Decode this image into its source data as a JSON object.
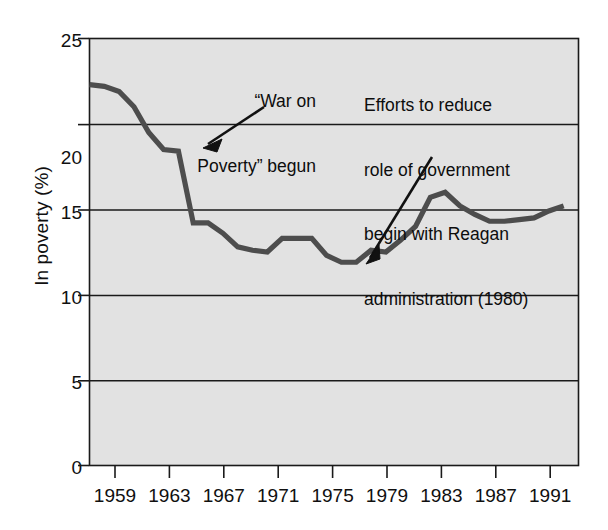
{
  "chart_data": {
    "type": "line",
    "title": "",
    "subtitle": "",
    "xlabel": "",
    "ylabel": "In poverty (%)",
    "xlim": [
      1959,
      1992
    ],
    "ylim": [
      0,
      25
    ],
    "grid": "horizontal",
    "legend": "none",
    "x_tick_labels": [
      "1959",
      "1963",
      "1967",
      "1971",
      "1975",
      "1979",
      "1983",
      "1987",
      "1991"
    ],
    "x_ticks": [
      1959,
      1963,
      1967,
      1971,
      1975,
      1979,
      1983,
      1987,
      1991
    ],
    "y_tick_labels": [
      "0",
      "5",
      "10",
      "15",
      "20",
      "25"
    ],
    "y_ticks": [
      0,
      5,
      10,
      15,
      20,
      25
    ],
    "series": [
      {
        "name": "In poverty (%)",
        "color": "#4d4d4d",
        "x": [
          1959,
          1960,
          1961,
          1962,
          1963,
          1964,
          1965,
          1966,
          1967,
          1968,
          1969,
          1970,
          1971,
          1972,
          1973,
          1974,
          1975,
          1976,
          1977,
          1978,
          1979,
          1980,
          1981,
          1982,
          1983,
          1984,
          1985,
          1986,
          1987,
          1988,
          1989,
          1990,
          1991
        ],
        "values": [
          22.3,
          22.2,
          21.9,
          21.0,
          19.5,
          18.5,
          18.4,
          14.2,
          14.2,
          13.6,
          12.8,
          12.6,
          12.5,
          13.3,
          13.3,
          13.3,
          12.3,
          11.9,
          11.9,
          12.6,
          12.5,
          13.2,
          14.0,
          15.7,
          16.0,
          15.2,
          14.7,
          14.3,
          14.3,
          14.4,
          14.5,
          14.9,
          15.2
        ]
      }
    ],
    "annotations": [
      {
        "id": "war-on-poverty",
        "lines": [
          "“War on",
          "Poverty” begun"
        ],
        "text": "“War on Poverty” begun",
        "points_to_year": 1965,
        "points_to_value": 18.4
      },
      {
        "id": "reagan-administration",
        "lines": [
          "Efforts to reduce",
          "role of government",
          "begin with Reagan",
          "administration (1980)"
        ],
        "text": "Efforts to reduce role of government begin with Reagan administration (1980)",
        "points_to_year": 1978,
        "points_to_value": 12.2
      }
    ],
    "colors": {
      "plot_background": "#e2e2e2",
      "line": "#4d4d4d",
      "frame": "#1a1a1a",
      "gridline": "#1a1a1a",
      "text": "#101010"
    }
  }
}
